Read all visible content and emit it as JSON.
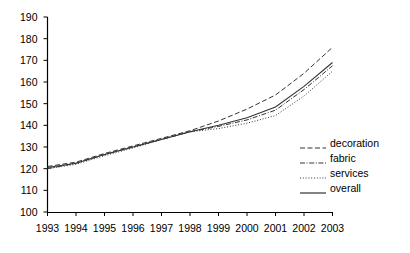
{
  "chart_data": {
    "type": "line",
    "title": "",
    "xlabel": "",
    "ylabel": "",
    "grid": false,
    "legend_position": "right",
    "x": [
      1993,
      1994,
      1995,
      1996,
      1997,
      1998,
      1999,
      2000,
      2001,
      2002,
      2003
    ],
    "categories": [
      "1993",
      "1994",
      "1995",
      "1996",
      "1997",
      "1998",
      "1999",
      "2000",
      "2001",
      "2002",
      "2003"
    ],
    "xlim": [
      1993,
      2003
    ],
    "ylim": [
      100,
      190
    ],
    "yticks": [
      100,
      110,
      120,
      130,
      140,
      150,
      160,
      170,
      180,
      190
    ],
    "series": [
      {
        "name": "decoration",
        "style": "dashed",
        "color": "#333333",
        "values": [
          121.0,
          123.0,
          127.0,
          130.5,
          134.0,
          137.5,
          142.0,
          147.5,
          154.0,
          164.0,
          176.0
        ]
      },
      {
        "name": "fabric",
        "style": "dash-dot",
        "color": "#333333",
        "values": [
          120.0,
          122.5,
          126.5,
          130.0,
          133.5,
          137.0,
          139.5,
          142.5,
          147.0,
          156.5,
          167.5
        ]
      },
      {
        "name": "services",
        "style": "dotted",
        "color": "#333333",
        "values": [
          120.0,
          122.0,
          126.0,
          129.5,
          133.5,
          137.0,
          138.5,
          141.0,
          144.5,
          153.5,
          165.0
        ]
      },
      {
        "name": "overall",
        "style": "solid",
        "color": "#333333",
        "values": [
          120.5,
          122.5,
          126.5,
          130.0,
          133.5,
          137.0,
          140.0,
          143.5,
          148.5,
          158.0,
          169.0
        ]
      }
    ]
  },
  "axes": {
    "y_tick_labels": [
      "190",
      "180",
      "170",
      "160",
      "150",
      "140",
      "130",
      "120",
      "110",
      "100"
    ],
    "x_tick_labels": [
      "1993",
      "1994",
      "1995",
      "1996",
      "1997",
      "1998",
      "1999",
      "2000",
      "2001",
      "2002",
      "2003"
    ]
  },
  "legend": {
    "items": [
      {
        "label": "decoration"
      },
      {
        "label": "fabric"
      },
      {
        "label": "services"
      },
      {
        "label": "overall"
      }
    ]
  }
}
